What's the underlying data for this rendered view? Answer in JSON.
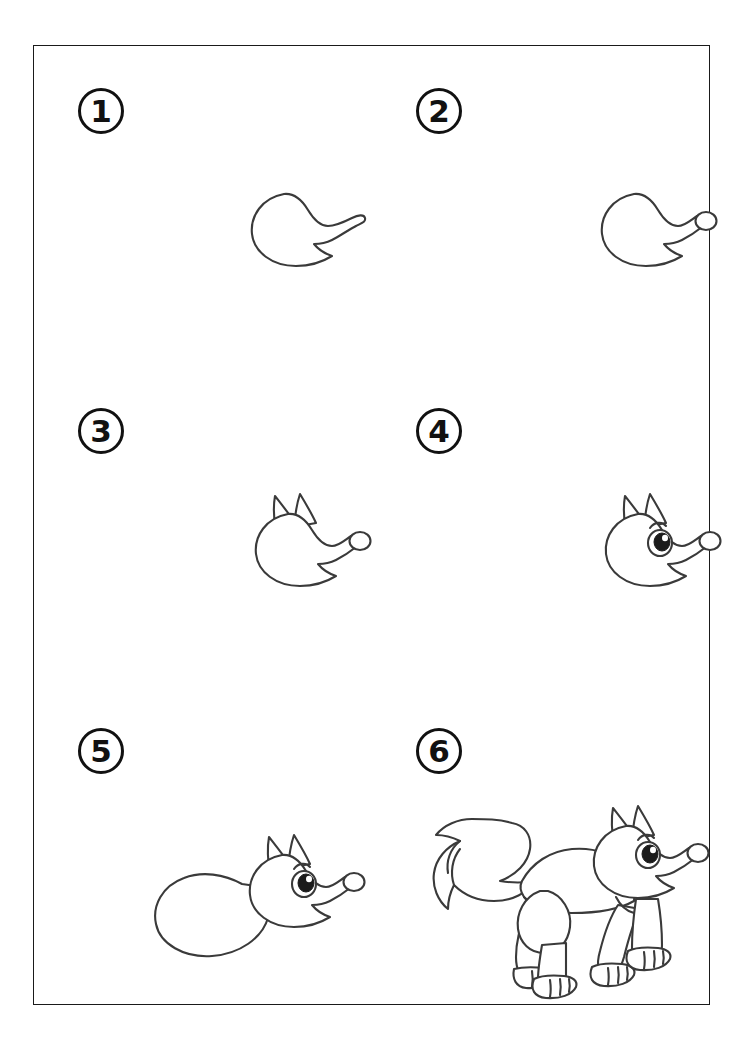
{
  "page": {
    "background_color": "#ffffff",
    "border_color": "#1a1a1a",
    "ink_color": "#3a3a3a"
  },
  "steps": [
    {
      "number": "1",
      "label": "Step 1",
      "description": "Draw the basic head shape with a pointed snout and open jaw",
      "parts_added": [
        "head outline",
        "snout",
        "lower jaw"
      ]
    },
    {
      "number": "2",
      "label": "Step 2",
      "description": "Add the round nose at the tip of the snout",
      "parts_added": [
        "nose"
      ]
    },
    {
      "number": "3",
      "label": "Step 3",
      "description": "Add two pointed ears on top of the head",
      "parts_added": [
        "left ear",
        "right ear"
      ]
    },
    {
      "number": "4",
      "label": "Step 4",
      "description": "Add the eye with pupil, highlight and eyebrow",
      "parts_added": [
        "eye",
        "pupil",
        "highlight",
        "eyebrow"
      ]
    },
    {
      "number": "5",
      "label": "Step 5",
      "description": "Draw the body extending back from the head",
      "parts_added": [
        "body"
      ]
    },
    {
      "number": "6",
      "label": "Step 6",
      "description": "Add four legs with paws and the bushy tail",
      "parts_added": [
        "front legs",
        "hind legs",
        "paws",
        "bushy tail"
      ]
    }
  ]
}
